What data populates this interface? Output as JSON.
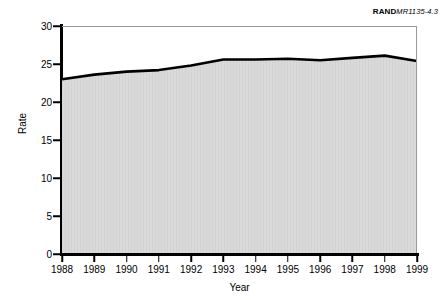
{
  "figure_id": {
    "brand": "RAND",
    "document_number": "MR1135-4.3"
  },
  "chart_data": {
    "type": "area",
    "title": "",
    "xlabel": "Year",
    "ylabel": "Rate",
    "categories": [
      1988,
      1989,
      1990,
      1991,
      1992,
      1993,
      1994,
      1995,
      1996,
      1997,
      1998,
      1999
    ],
    "x_tick_labels": [
      "1988",
      "1989",
      "1990",
      "1991",
      "1992",
      "1993",
      "1994",
      "1995",
      "1996",
      "1997",
      "1998",
      "1999"
    ],
    "values": [
      23.0,
      23.6,
      24.0,
      24.2,
      24.8,
      25.6,
      25.6,
      25.7,
      25.5,
      25.8,
      26.1,
      25.4
    ],
    "y_tick_labels": [
      "0",
      "5",
      "10",
      "15",
      "20",
      "25",
      "30"
    ],
    "y_ticks": [
      0,
      5,
      10,
      15,
      20,
      25,
      30
    ],
    "ylim": [
      0,
      30
    ],
    "xlim": [
      1988,
      1999
    ],
    "grid": false,
    "legend": false,
    "line_color": "#000000",
    "fill_color": "#d9d9d9",
    "axis_color": "#000000",
    "frame_color": "#9a9a9a"
  }
}
